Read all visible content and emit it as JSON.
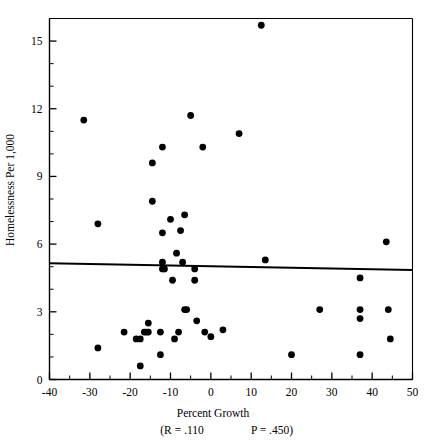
{
  "chart_data": {
    "type": "scatter",
    "title": "",
    "xlabel": "Percent Growth",
    "ylabel": "Homelessness Per 1,000",
    "xlim": [
      -40,
      50
    ],
    "ylim": [
      0,
      16
    ],
    "grid": false,
    "legend": "none",
    "x_ticks": [
      -40,
      -30,
      -20,
      -10,
      0,
      10,
      20,
      30,
      40,
      50
    ],
    "x_tick_labels": [
      "-40",
      "-30",
      "-20",
      "-10",
      "0",
      "10",
      "20",
      "30",
      "40",
      "50"
    ],
    "x_minor_interval": 5,
    "y_ticks": [
      0,
      3,
      6,
      9,
      12,
      15
    ],
    "y_tick_labels": [
      "0",
      "3",
      "6",
      "9",
      "12",
      "15"
    ],
    "y_minor_interval": 1,
    "points": [
      {
        "x": -31.5,
        "y": 11.5
      },
      {
        "x": -28.0,
        "y": 6.9
      },
      {
        "x": -28.0,
        "y": 1.4
      },
      {
        "x": -21.5,
        "y": 2.1
      },
      {
        "x": -18.5,
        "y": 1.8
      },
      {
        "x": -17.5,
        "y": 1.8
      },
      {
        "x": -17.5,
        "y": 0.6
      },
      {
        "x": -16.5,
        "y": 2.1
      },
      {
        "x": -16.0,
        "y": 2.1
      },
      {
        "x": -15.5,
        "y": 2.1
      },
      {
        "x": -15.5,
        "y": 2.5
      },
      {
        "x": -14.5,
        "y": 9.6
      },
      {
        "x": -14.5,
        "y": 7.9
      },
      {
        "x": -12.5,
        "y": 2.1
      },
      {
        "x": -12.5,
        "y": 1.1
      },
      {
        "x": -12.0,
        "y": 10.3
      },
      {
        "x": -12.0,
        "y": 6.5
      },
      {
        "x": -12.0,
        "y": 5.2
      },
      {
        "x": -12.0,
        "y": 4.9
      },
      {
        "x": -11.5,
        "y": 4.9
      },
      {
        "x": -10.0,
        "y": 7.1
      },
      {
        "x": -9.5,
        "y": 4.4
      },
      {
        "x": -9.0,
        "y": 1.8
      },
      {
        "x": -8.5,
        "y": 5.6
      },
      {
        "x": -8.0,
        "y": 2.1
      },
      {
        "x": -7.5,
        "y": 6.6
      },
      {
        "x": -7.0,
        "y": 5.2
      },
      {
        "x": -6.5,
        "y": 7.3
      },
      {
        "x": -6.5,
        "y": 3.1
      },
      {
        "x": -6.0,
        "y": 3.1
      },
      {
        "x": -5.0,
        "y": 11.7
      },
      {
        "x": -4.0,
        "y": 4.9
      },
      {
        "x": -4.0,
        "y": 4.4
      },
      {
        "x": -3.5,
        "y": 2.6
      },
      {
        "x": -2.0,
        "y": 10.3
      },
      {
        "x": -1.5,
        "y": 2.1
      },
      {
        "x": 0.0,
        "y": 1.9
      },
      {
        "x": 3.0,
        "y": 2.2
      },
      {
        "x": 7.0,
        "y": 10.9
      },
      {
        "x": 12.5,
        "y": 15.7
      },
      {
        "x": 13.5,
        "y": 5.3
      },
      {
        "x": 20.0,
        "y": 1.1
      },
      {
        "x": 27.0,
        "y": 3.1
      },
      {
        "x": 37.0,
        "y": 4.5
      },
      {
        "x": 37.0,
        "y": 3.1
      },
      {
        "x": 37.0,
        "y": 2.7
      },
      {
        "x": 37.0,
        "y": 1.1
      },
      {
        "x": 43.5,
        "y": 6.1
      },
      {
        "x": 44.0,
        "y": 3.1
      },
      {
        "x": 44.5,
        "y": 1.8
      }
    ],
    "regression": {
      "x_start": -40,
      "y_start": 5.15,
      "x_end": 50,
      "y_end": 4.85
    },
    "annotations": {
      "r_label": "(R = .110",
      "p_label": "P = .450)"
    }
  }
}
